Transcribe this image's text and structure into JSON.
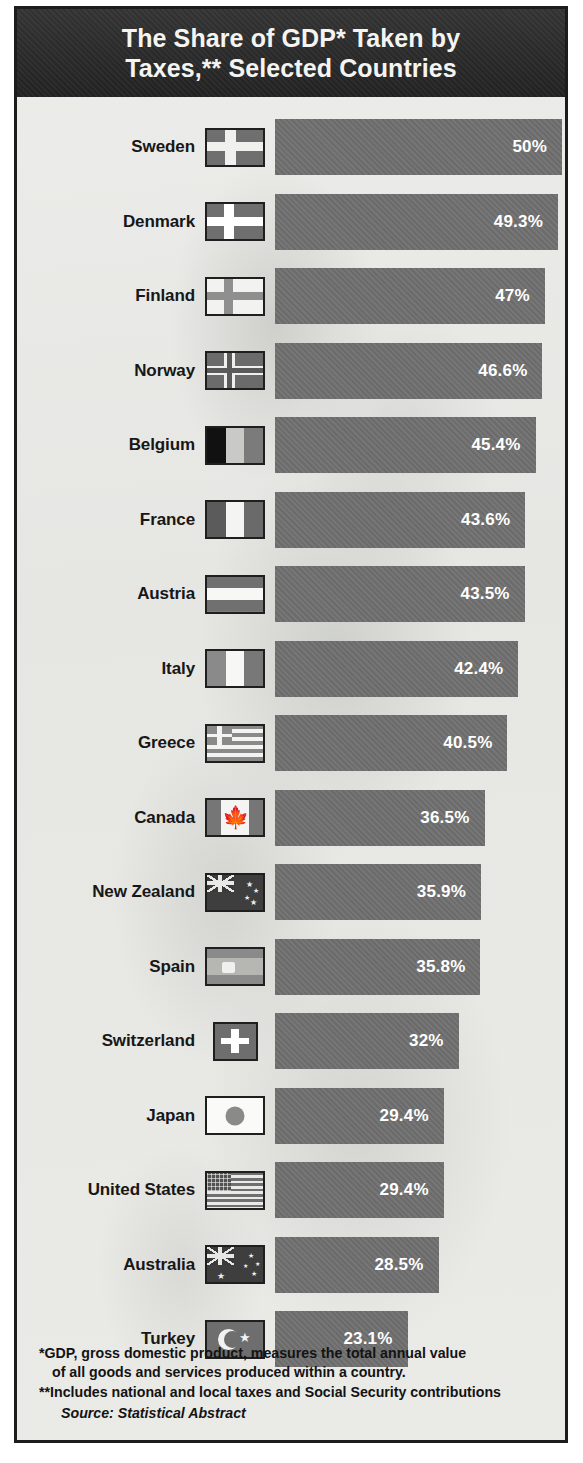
{
  "header": {
    "title_line1": "The Share of GDP* Taken by",
    "title_line2": "Taxes,** Selected Countries"
  },
  "colors": {
    "header_band": "#2a2a2a",
    "bar": "#6f6f6f",
    "background": "#e9e9e6",
    "frame": "#1c1c1c",
    "bar_label": "#ffffff",
    "country_label": "#171717"
  },
  "footnotes": {
    "line1": "*GDP, gross domestic product, measures the total annual value",
    "line2": "of all goods and services produced within a country.",
    "line3": "**Includes national and local taxes and Social Security contributions",
    "source_label": "Source:",
    "source_value": " Statistical Abstract"
  },
  "chart_data": {
    "type": "bar",
    "orientation": "horizontal",
    "title": "The Share of GDP* Taken by Taxes,** Selected Countries",
    "xlabel": "",
    "ylabel": "",
    "unit": "percent of GDP",
    "xlim": [
      0,
      50
    ],
    "grid": false,
    "legend": "none",
    "categories": [
      "Sweden",
      "Denmark",
      "Finland",
      "Norway",
      "Belgium",
      "France",
      "Austria",
      "Italy",
      "Greece",
      "Canada",
      "New Zealand",
      "Spain",
      "Switzerland",
      "Japan",
      "United States",
      "Australia",
      "Turkey"
    ],
    "values": [
      50,
      49.3,
      47,
      46.6,
      45.4,
      43.6,
      43.5,
      42.4,
      40.5,
      36.5,
      35.9,
      35.8,
      32,
      29.4,
      29.4,
      28.5,
      23.1
    ],
    "labels": [
      "50%",
      "49.3%",
      "47%",
      "46.6%",
      "45.4%",
      "43.6%",
      "43.5%",
      "42.4%",
      "40.5%",
      "36.5%",
      "35.9%",
      "35.8%",
      "32%",
      "29.4%",
      "29.4%",
      "28.5%",
      "23.1%"
    ],
    "rows": [
      {
        "country": "Sweden",
        "value": 50,
        "label": "50%",
        "flag": "flag-sweden"
      },
      {
        "country": "Denmark",
        "value": 49.3,
        "label": "49.3%",
        "flag": "flag-denmark"
      },
      {
        "country": "Finland",
        "value": 47,
        "label": "47%",
        "flag": "flag-finland"
      },
      {
        "country": "Norway",
        "value": 46.6,
        "label": "46.6%",
        "flag": "flag-norway"
      },
      {
        "country": "Belgium",
        "value": 45.4,
        "label": "45.4%",
        "flag": "flag-belgium"
      },
      {
        "country": "France",
        "value": 43.6,
        "label": "43.6%",
        "flag": "flag-france"
      },
      {
        "country": "Austria",
        "value": 43.5,
        "label": "43.5%",
        "flag": "flag-austria"
      },
      {
        "country": "Italy",
        "value": 42.4,
        "label": "42.4%",
        "flag": "flag-italy"
      },
      {
        "country": "Greece",
        "value": 40.5,
        "label": "40.5%",
        "flag": "flag-greece"
      },
      {
        "country": "Canada",
        "value": 36.5,
        "label": "36.5%",
        "flag": "flag-canada"
      },
      {
        "country": "New Zealand",
        "value": 35.9,
        "label": "35.9%",
        "flag": "flag-new-zealand"
      },
      {
        "country": "Spain",
        "value": 35.8,
        "label": "35.8%",
        "flag": "flag-spain"
      },
      {
        "country": "Switzerland",
        "value": 32,
        "label": "32%",
        "flag": "flag-switzerland"
      },
      {
        "country": "Japan",
        "value": 29.4,
        "label": "29.4%",
        "flag": "flag-japan"
      },
      {
        "country": "United States",
        "value": 29.4,
        "label": "29.4%",
        "flag": "flag-united-states"
      },
      {
        "country": "Australia",
        "value": 28.5,
        "label": "28.5%",
        "flag": "flag-australia"
      },
      {
        "country": "Turkey",
        "value": 23.1,
        "label": "23.1%",
        "flag": "flag-turkey"
      }
    ]
  }
}
